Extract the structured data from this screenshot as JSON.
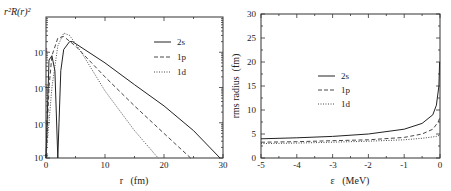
{
  "chart_data": [
    {
      "type": "line",
      "title": "",
      "xlabel": "r (fm)",
      "ylabel": "r^2 R(r)^2",
      "xlim": [
        0,
        30
      ],
      "ylim": [
        0.0001,
        1
      ],
      "yscale": "log",
      "xticks": [
        "0",
        "10",
        "20",
        "30"
      ],
      "yticks": [
        "10^-4",
        "10^-3",
        "10^-2",
        "10^-1"
      ],
      "legend_position": "upper right",
      "grid": false,
      "series": [
        {
          "name": "2s",
          "style": "solid",
          "x": [
            0,
            0.5,
            1.0,
            1.5,
            2.0,
            2.2,
            2.5,
            3.0,
            4.0,
            4.5,
            10,
            15,
            20,
            25,
            29.5
          ],
          "y": [
            0.0001,
            0.06,
            0.08,
            0.03,
            0.0001,
            0.001,
            0.03,
            0.12,
            0.2,
            0.2,
            0.05,
            0.012,
            0.003,
            0.0006,
            0.0001
          ]
        },
        {
          "name": "1p",
          "style": "dashed",
          "x": [
            0,
            0.5,
            1,
            2,
            3,
            5,
            10,
            15,
            20,
            24.5
          ],
          "y": [
            0.0001,
            0.01,
            0.08,
            0.25,
            0.28,
            0.15,
            0.02,
            0.003,
            0.0005,
            0.0001
          ]
        },
        {
          "name": "1d",
          "style": "dotted",
          "x": [
            0,
            1,
            2,
            3,
            4,
            6,
            10,
            15,
            19
          ],
          "y": [
            0.0001,
            0.01,
            0.15,
            0.35,
            0.3,
            0.1,
            0.008,
            0.0006,
            0.0001
          ]
        }
      ]
    },
    {
      "type": "line",
      "title": "",
      "xlabel": "ε (MeV)",
      "ylabel": "rms radius (fm)",
      "xlim": [
        -5,
        0
      ],
      "ylim": [
        0,
        30
      ],
      "xticks": [
        "-5",
        "-4",
        "-3",
        "-2",
        "-1",
        "0"
      ],
      "yticks": [
        "0",
        "5",
        "10",
        "15",
        "20",
        "25",
        "30"
      ],
      "legend_position": "center",
      "grid": false,
      "series": [
        {
          "name": "2s",
          "style": "solid",
          "x": [
            -5,
            -4,
            -3,
            -2,
            -1,
            -0.5,
            -0.2,
            -0.1,
            -0.03,
            -0.01
          ],
          "y": [
            4.0,
            4.2,
            4.5,
            5.0,
            6.0,
            7.2,
            9.0,
            11.0,
            15.0,
            20.0
          ]
        },
        {
          "name": "1p",
          "style": "dashed",
          "x": [
            -5,
            -4,
            -3,
            -2,
            -1,
            -0.5,
            -0.2,
            -0.05,
            0
          ],
          "y": [
            3.3,
            3.4,
            3.6,
            3.8,
            4.3,
            5.0,
            6.0,
            7.5,
            8.5
          ]
        },
        {
          "name": "1d",
          "style": "dotted",
          "x": [
            -5,
            -4,
            -3,
            -2,
            -1,
            -0.5,
            -0.1,
            0
          ],
          "y": [
            3.0,
            3.1,
            3.3,
            3.5,
            3.8,
            4.1,
            4.5,
            4.8
          ]
        }
      ]
    }
  ],
  "left": {
    "ylabel": "r²R(r)²",
    "xlabel": "r   (fm)",
    "xtick_labels": [
      "0",
      "10",
      "20",
      "30"
    ],
    "ytick_bases": [
      "10",
      "10",
      "10",
      "10"
    ],
    "ytick_exps": [
      "-1",
      "-2",
      "-3",
      "-4"
    ],
    "legend": [
      "2s",
      "1p",
      "1d"
    ]
  },
  "right": {
    "ylabel": "rms radius  (fm)",
    "xlabel": "ε   (MeV)",
    "xtick_labels": [
      "-5",
      "-4",
      "-3",
      "-2",
      "-1",
      "0"
    ],
    "ytick_labels": [
      "0",
      "5",
      "10",
      "15",
      "20",
      "25",
      "30"
    ],
    "legend": [
      "2s",
      "1p",
      "1d"
    ]
  }
}
